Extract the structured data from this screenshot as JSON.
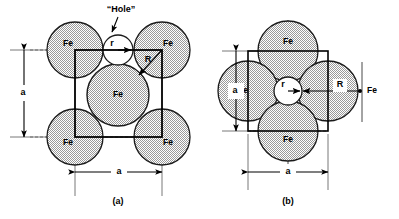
{
  "figure": {
    "type": "crystal-structure-diagram",
    "background_color": "#ffffff",
    "atom_fill_color": "#d8d8d8",
    "atom_stroke_color": "#1a1a1a",
    "line_color": "#000000",
    "hole_fill_color": "#ffffff"
  },
  "panels": [
    {
      "id": "a",
      "caption": "(a)",
      "cell_label": "a",
      "cell_label_vertical": "a",
      "hole_callout": "“Hole”",
      "hole_radius_label": "r",
      "atom_radius_label": "R",
      "atoms": [
        {
          "label": "Fe",
          "position": "top-left-corner"
        },
        {
          "label": "Fe",
          "position": "top-right-corner"
        },
        {
          "label": "Fe",
          "position": "bottom-left-corner"
        },
        {
          "label": "Fe",
          "position": "bottom-right-corner"
        },
        {
          "label": "Fe",
          "position": "body-center"
        }
      ]
    },
    {
      "id": "b",
      "caption": "(b)",
      "cell_label": "a",
      "cell_label_vertical": "a",
      "hole_radius_label": "r",
      "atom_radius_label": "R",
      "atoms": [
        {
          "label": "Fe",
          "position": "top-edge-center"
        },
        {
          "label": "Fe",
          "position": "left-edge-center"
        },
        {
          "label": "Fe",
          "position": "right-edge-center"
        },
        {
          "label": "Fe",
          "position": "bottom-edge-center"
        }
      ]
    }
  ]
}
